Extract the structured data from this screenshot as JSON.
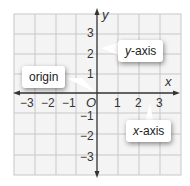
{
  "diagram": {
    "type": "coordinate-plane",
    "axes": {
      "x_label": "x",
      "y_label": "y",
      "origin_label": "O"
    },
    "x_ticks": [
      "−3",
      "−2",
      "−1",
      "1",
      "2",
      "3"
    ],
    "y_ticks": [
      "3",
      "2",
      "1",
      "−1",
      "−2",
      "−3"
    ],
    "callouts": {
      "origin": "origin",
      "y_axis_var": "y",
      "y_axis_suffix": "-axis",
      "x_axis_var": "x",
      "x_axis_suffix": "-axis"
    },
    "colors": {
      "grid": "#c8c8c8",
      "grid_fill": "#f4f4f4",
      "axis": "#333333",
      "text": "#333333",
      "callout_bg": "#ffffff"
    }
  }
}
